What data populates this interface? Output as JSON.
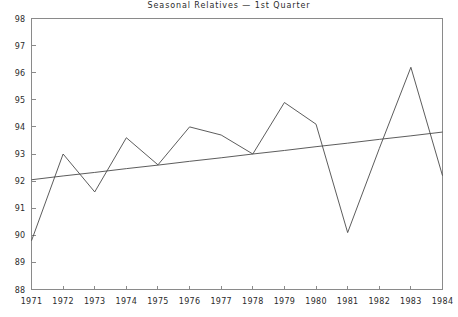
{
  "chart_data": {
    "type": "line",
    "title": "Seasonal Relatives — 1st Quarter",
    "xlabel": "",
    "ylabel": "",
    "x": [
      1971,
      1972,
      1973,
      1974,
      1975,
      1976,
      1977,
      1978,
      1979,
      1980,
      1981,
      1982,
      1983,
      1984
    ],
    "categories": [
      "1971",
      "1972",
      "1973",
      "1974",
      "1975",
      "1976",
      "1977",
      "1978",
      "1979",
      "1980",
      "1981",
      "1982",
      "1983",
      "1984"
    ],
    "series": [
      {
        "name": "Seasonal Relative",
        "values": [
          89.8,
          93.0,
          91.6,
          93.6,
          92.6,
          94.0,
          93.7,
          93.0,
          94.9,
          94.1,
          90.1,
          93.2,
          96.2,
          92.2
        ]
      },
      {
        "name": "Trend",
        "values": [
          92.05,
          92.19,
          92.32,
          92.46,
          92.59,
          92.73,
          92.86,
          93.0,
          93.13,
          93.27,
          93.4,
          93.54,
          93.67,
          93.81
        ]
      }
    ],
    "ylim": [
      88,
      98
    ],
    "xlim": [
      1971,
      1984
    ],
    "yticks": [
      88,
      89,
      90,
      91,
      92,
      93,
      94,
      95,
      96,
      97,
      98
    ],
    "ytick_labels": [
      "88",
      "89",
      "90",
      "91",
      "92",
      "93",
      "94",
      "95",
      "96",
      "97",
      "98"
    ],
    "xticks": [
      1971,
      1972,
      1973,
      1974,
      1975,
      1976,
      1977,
      1978,
      1979,
      1980,
      1981,
      1982,
      1983,
      1984
    ],
    "xtick_labels": [
      "1971",
      "1972",
      "1973",
      "1974",
      "1975",
      "1976",
      "1977",
      "1978",
      "1979",
      "1980",
      "1981",
      "1982",
      "1983",
      "1984"
    ],
    "grid": false,
    "legend": "none",
    "line_color": "#4a4a4a",
    "axis_color": "#8a8a8a",
    "text_color": "#2b2b2b",
    "background": "#ffffff"
  }
}
